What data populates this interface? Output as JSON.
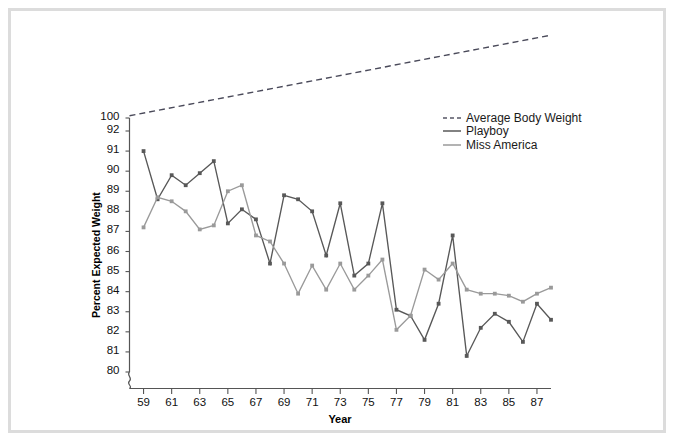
{
  "chart_data": {
    "type": "line",
    "title": "",
    "xlabel": "Year",
    "ylabel": "Percent Expected Weight",
    "grid": false,
    "legend_position": "top-right",
    "axis_note": "y-axis is broken: 100 sits above a compressed gap, then 92 down to 80 in unit steps",
    "ytick_labels": [
      "100",
      "92",
      "91",
      "90",
      "89",
      "88",
      "87",
      "86",
      "85",
      "84",
      "83",
      "82",
      "81",
      "80"
    ],
    "ytick_values": [
      100,
      92,
      91,
      90,
      89,
      88,
      87,
      86,
      85,
      84,
      83,
      82,
      81,
      80
    ],
    "ylim": [
      80,
      100
    ],
    "xtick_labels": [
      "59",
      "61",
      "63",
      "65",
      "67",
      "69",
      "71",
      "73",
      "75",
      "77",
      "79",
      "81",
      "83",
      "85",
      "87"
    ],
    "xtick_values": [
      59,
      61,
      63,
      65,
      67,
      69,
      71,
      73,
      75,
      77,
      79,
      81,
      83,
      85,
      87
    ],
    "xlim": [
      58,
      88
    ],
    "series": [
      {
        "name": "Average Body Weight",
        "style": "dashed",
        "color": "#4a4a5a",
        "markers": false,
        "x": [
          58,
          88
        ],
        "values": [
          100.2,
          107.5
        ]
      },
      {
        "name": "Playboy",
        "style": "solid",
        "color": "#585858",
        "markers": true,
        "x": [
          59,
          60,
          61,
          62,
          63,
          64,
          65,
          66,
          67,
          68,
          69,
          70,
          71,
          72,
          73,
          74,
          75,
          76,
          77,
          78,
          79,
          80,
          81,
          82,
          83,
          84,
          85,
          86,
          87,
          88
        ],
        "values": [
          91.0,
          88.6,
          89.8,
          89.3,
          89.9,
          90.5,
          87.4,
          88.1,
          87.6,
          85.4,
          88.8,
          88.6,
          88.0,
          85.8,
          88.4,
          84.8,
          85.4,
          88.4,
          83.1,
          82.8,
          81.6,
          83.4,
          86.8,
          80.8,
          82.2,
          82.9,
          82.5,
          81.5,
          83.4,
          82.6
        ]
      },
      {
        "name": "Miss America",
        "style": "solid",
        "color": "#9a9a9a",
        "markers": true,
        "x": [
          59,
          60,
          61,
          62,
          63,
          64,
          65,
          66,
          67,
          68,
          69,
          70,
          71,
          72,
          73,
          74,
          75,
          76,
          77,
          78,
          79,
          80,
          81,
          82,
          83,
          84,
          85,
          86,
          87,
          88
        ],
        "values": [
          87.2,
          88.7,
          88.5,
          88.0,
          87.1,
          87.3,
          89.0,
          89.3,
          86.8,
          86.5,
          85.4,
          83.9,
          85.3,
          84.1,
          85.4,
          84.1,
          84.8,
          85.6,
          82.1,
          82.8,
          85.1,
          84.6,
          85.4,
          84.1,
          83.9,
          83.9,
          83.8,
          83.5,
          83.9,
          84.2
        ]
      }
    ]
  },
  "legend": {
    "items": [
      {
        "label": "Average Body Weight"
      },
      {
        "label": "Playboy"
      },
      {
        "label": "Miss America"
      }
    ]
  }
}
